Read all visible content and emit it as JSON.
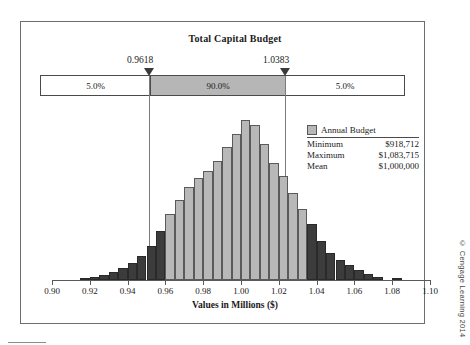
{
  "chart_data": {
    "type": "bar",
    "title": "Total Capital Budget",
    "xlabel": "Values in Millions ($)",
    "ylabel": "",
    "xlim": [
      0.9,
      1.1
    ],
    "ylim": [
      0,
      1.0
    ],
    "grid": false,
    "tick_labels": [
      "0.90",
      "0.92",
      "0.94",
      "0.96",
      "0.98",
      "1.00",
      "1.02",
      "1.04",
      "1.06",
      "1.08",
      "1.10"
    ],
    "tick_values": [
      0.9,
      0.92,
      0.94,
      0.96,
      0.98,
      1.0,
      1.02,
      1.04,
      1.06,
      1.08,
      1.1
    ],
    "legend_position": "right",
    "series_name": "Annual Budget",
    "bin_width": 0.005,
    "x": [
      0.9175,
      0.9225,
      0.9275,
      0.9325,
      0.9375,
      0.9425,
      0.9475,
      0.9525,
      0.9575,
      0.9625,
      0.9675,
      0.9725,
      0.9775,
      0.9825,
      0.9875,
      0.9925,
      0.9975,
      1.0025,
      1.0075,
      1.0125,
      1.0175,
      1.0225,
      1.0275,
      1.0325,
      1.0375,
      1.0425,
      1.0475,
      1.0525,
      1.0575,
      1.0625,
      1.0675,
      1.0725,
      1.0825
    ],
    "values": [
      0.012,
      0.02,
      0.03,
      0.046,
      0.068,
      0.098,
      0.14,
      0.2,
      0.29,
      0.39,
      0.47,
      0.545,
      0.6,
      0.64,
      0.7,
      0.78,
      0.86,
      0.94,
      0.91,
      0.8,
      0.69,
      0.61,
      0.51,
      0.42,
      0.33,
      0.23,
      0.16,
      0.12,
      0.09,
      0.058,
      0.036,
      0.02,
      0.014
    ],
    "bar_states": [
      "outside",
      "outside",
      "outside",
      "outside",
      "outside",
      "outside",
      "outside",
      "outside",
      "outside",
      "inside",
      "inside",
      "inside",
      "inside",
      "inside",
      "inside",
      "inside",
      "inside",
      "inside",
      "inside",
      "inside",
      "inside",
      "inside",
      "inside",
      "inside",
      "outside",
      "outside",
      "outside",
      "outside",
      "outside",
      "outside",
      "outside",
      "outside",
      "outside"
    ],
    "colors": {
      "inside": "#b8b8b8",
      "outside": "#3c3c3c",
      "band_fill": "#b6b6b6"
    },
    "annotations": {
      "lower_bound": 0.9618,
      "upper_bound": 1.0383,
      "left_tail_pct": "5.0%",
      "center_pct": "90.0%",
      "right_tail_pct": "5.0%"
    }
  },
  "certainty_band": {
    "lower_label": "0.9618",
    "upper_label": "1.0383",
    "left_pct": "5.0%",
    "center_pct": "90.0%",
    "right_pct": "5.0%"
  },
  "legend": {
    "title": "Annual Budget",
    "rows": [
      {
        "label": "Minimum",
        "value": "$918,712"
      },
      {
        "label": "Maximum",
        "value": "$1,083,715"
      },
      {
        "label": "Mean",
        "value": "$1,000,000"
      }
    ]
  },
  "footer": {
    "copyright": "© Cengage Learning 2014"
  }
}
